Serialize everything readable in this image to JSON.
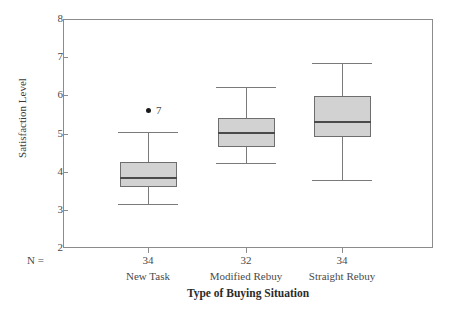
{
  "chart_data": {
    "type": "box",
    "title": "",
    "xlabel": "Type of Buying Situation",
    "ylabel": "Satisfaction Level",
    "ylim": [
      2,
      8
    ],
    "yticks": [
      2,
      3,
      4,
      5,
      6,
      7,
      8
    ],
    "ytick_labels": [
      "2",
      "3",
      "4",
      "5",
      "6",
      "7",
      "8"
    ],
    "grid": false,
    "legend": "none",
    "n_label": "N =",
    "categories": [
      "New Task",
      "Modified Rebuy",
      "Straight Rebuy"
    ],
    "counts": [
      "34",
      "32",
      "34"
    ],
    "boxes": [
      {
        "category": "New Task",
        "n": "34",
        "whisker_low": 3.15,
        "q1": 3.6,
        "median": 3.85,
        "q3": 4.25,
        "whisker_high": 5.05,
        "outliers": [
          {
            "value": 5.6,
            "label": "7"
          }
        ]
      },
      {
        "category": "Modified Rebuy",
        "n": "32",
        "whisker_low": 4.22,
        "q1": 4.65,
        "median": 5.05,
        "q3": 5.4,
        "whisker_high": 6.22,
        "outliers": []
      },
      {
        "category": "Straight Rebuy",
        "n": "34",
        "whisker_low": 3.78,
        "q1": 4.92,
        "median": 5.32,
        "q3": 5.98,
        "whisker_high": 6.85,
        "outliers": []
      }
    ],
    "colors": {
      "box_fill": "#d2d2d2",
      "box_edge": "#6e6e6e",
      "median": "#4a4a4a",
      "whisker": "#7a7a7a",
      "frame": "#8c8c8c",
      "outlier": "#1a1a1a",
      "background": "#ffffff",
      "text": "#3a3a3a"
    }
  }
}
